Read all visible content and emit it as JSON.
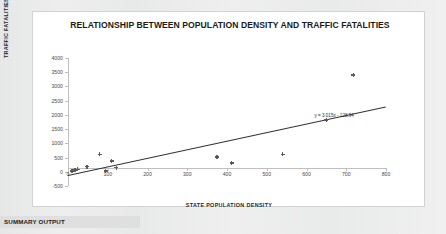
{
  "chart_data": {
    "type": "scatter",
    "title": "RELATIONSHIP BETWEEN POPULATION DENSITY AND TRAFFIC FATALITIES",
    "xlabel": "STATE POPULATION DENSITY",
    "ylabel": "TRAFFIC FATALITIES",
    "xlim": [
      0,
      800
    ],
    "ylim": [
      -500,
      4000
    ],
    "xticks": [
      0,
      100,
      200,
      300,
      400,
      500,
      600,
      700,
      800
    ],
    "yticks": [
      -500,
      0,
      500,
      1000,
      1500,
      2000,
      2500,
      3000,
      3500,
      4000
    ],
    "grid": false,
    "legend": "none",
    "marker": "asterisk",
    "marker_color": "#5a5a5a",
    "trendline": {
      "equation": "y = 3.015x - 128.94",
      "slope": 3.015,
      "intercept": -128.94,
      "color": "#333333"
    },
    "points": [
      {
        "x": 10,
        "y": 30
      },
      {
        "x": 18,
        "y": 60
      },
      {
        "x": 24,
        "y": 85
      },
      {
        "x": 48,
        "y": 180
      },
      {
        "x": 80,
        "y": 610
      },
      {
        "x": 95,
        "y": 30
      },
      {
        "x": 110,
        "y": 380
      },
      {
        "x": 122,
        "y": 140
      },
      {
        "x": 375,
        "y": 520
      },
      {
        "x": 412,
        "y": 310
      },
      {
        "x": 540,
        "y": 610
      },
      {
        "x": 650,
        "y": 1820
      },
      {
        "x": 718,
        "y": 3400
      }
    ]
  },
  "summary": {
    "label": "SUMMARY OUTPUT"
  }
}
